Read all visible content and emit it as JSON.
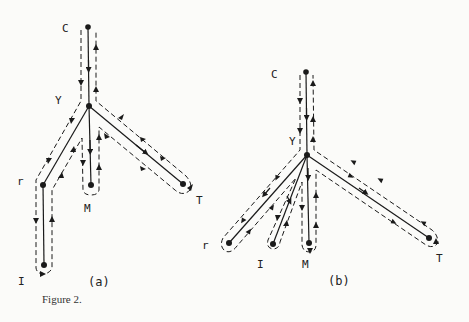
{
  "figure": {
    "caption": "Figure 2.",
    "panels": [
      {
        "id": "a",
        "label": "(a)",
        "nodes": [
          {
            "name": "C",
            "x": 88,
            "y": 27
          },
          {
            "name": "Y",
            "x": 89,
            "y": 106
          },
          {
            "name": "r",
            "x": 43,
            "y": 185
          },
          {
            "name": "I",
            "x": 44,
            "y": 265
          },
          {
            "name": "M",
            "x": 91,
            "y": 185
          },
          {
            "name": "T",
            "x": 183,
            "y": 184
          }
        ],
        "edges": [
          [
            "C",
            "Y"
          ],
          [
            "Y",
            "r"
          ],
          [
            "r",
            "I"
          ],
          [
            "Y",
            "M"
          ],
          [
            "Y",
            "T"
          ]
        ]
      },
      {
        "id": "b",
        "label": "(b)",
        "nodes": [
          {
            "name": "C",
            "x": 306,
            "y": 72
          },
          {
            "name": "Y",
            "x": 307,
            "y": 155
          },
          {
            "name": "r",
            "x": 229,
            "y": 243
          },
          {
            "name": "I",
            "x": 273,
            "y": 244
          },
          {
            "name": "M",
            "x": 309,
            "y": 243
          },
          {
            "name": "T",
            "x": 429,
            "y": 238
          }
        ],
        "edges": [
          [
            "C",
            "Y"
          ],
          [
            "Y",
            "r"
          ],
          [
            "Y",
            "I"
          ],
          [
            "Y",
            "M"
          ],
          [
            "Y",
            "T"
          ]
        ]
      }
    ]
  },
  "labels": {
    "a": {
      "C": "C",
      "Y": "Y",
      "r": "r",
      "I": "I",
      "M": "M",
      "T": "T",
      "panel": "(a)"
    },
    "b": {
      "C": "C",
      "Y": "Y",
      "r": "r",
      "I": "I",
      "M": "M",
      "T": "T",
      "panel": "(b)"
    }
  },
  "colors": {
    "ink": "#1a1a1a",
    "paper": "#fbfbf9"
  }
}
